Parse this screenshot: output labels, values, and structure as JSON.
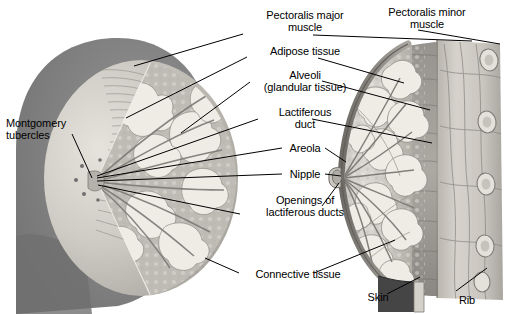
{
  "figure": {
    "background_color": "#ffffff",
    "text_color": "#000000",
    "view_left": "anterior cut-away view",
    "view_right": "sagittal cross-section view"
  },
  "labels": [
    {
      "id": "pectoralis-major-muscle",
      "line1": "Pectoralis major",
      "line2": "muscle",
      "x": 245,
      "y": 10,
      "w": 120,
      "align": "ctr"
    },
    {
      "id": "pectoralis-minor-muscle",
      "line1": "Pectoralis minor",
      "line2": "muscle",
      "x": 367,
      "y": 7,
      "w": 120,
      "align": "ctr"
    },
    {
      "id": "adipose-tissue",
      "line1": "Adipose tissue",
      "line2": "",
      "x": 245,
      "y": 46,
      "w": 120,
      "align": "ctr"
    },
    {
      "id": "alveoli-glandular-tissue",
      "line1": "Alveoli",
      "line2": "(glandular tissue)",
      "x": 245,
      "y": 70,
      "w": 120,
      "align": "ctr"
    },
    {
      "id": "lactiferous-duct",
      "line1": "Lactiferous",
      "line2": "duct",
      "x": 245,
      "y": 107,
      "w": 120,
      "align": "ctr"
    },
    {
      "id": "areola",
      "line1": "Areola",
      "line2": "",
      "x": 245,
      "y": 143,
      "w": 120,
      "align": "ctr"
    },
    {
      "id": "nipple",
      "line1": "Nipple",
      "line2": "",
      "x": 245,
      "y": 169,
      "w": 120,
      "align": "ctr"
    },
    {
      "id": "openings-of-lactiferous-ducts",
      "line1": "Openings of",
      "line2": "lactiferous ducts",
      "x": 243,
      "y": 195,
      "w": 124,
      "align": "ctr"
    },
    {
      "id": "montgomery-tubercles",
      "line1": "Montgomery",
      "line2": "tubercles",
      "x": 6,
      "y": 118,
      "w": 90,
      "align": "lft"
    },
    {
      "id": "connective-tissue",
      "line1": "Connective tissue",
      "line2": "",
      "x": 243,
      "y": 269,
      "w": 110,
      "align": "ctr"
    },
    {
      "id": "skin",
      "line1": "Skin",
      "line2": "",
      "x": 358,
      "y": 292,
      "w": 40,
      "align": "ctr"
    },
    {
      "id": "rib",
      "line1": "Rib",
      "line2": "",
      "x": 452,
      "y": 295,
      "w": 30,
      "align": "ctr"
    }
  ],
  "leader_lines": [
    {
      "id": "leader-pectoralis-major-left",
      "x1": 243,
      "y1": 34,
      "x2": 134,
      "y2": 66
    },
    {
      "id": "leader-pectoralis-major-right",
      "x2": 472,
      "y2": 41,
      "x1": 313,
      "y1": 35
    },
    {
      "id": "leader-pectoralis-minor",
      "x1": 418,
      "y1": 30,
      "x2": 500,
      "y2": 44
    },
    {
      "id": "leader-adipose-left",
      "x1": 247,
      "y1": 57,
      "x2": 126,
      "y2": 118
    },
    {
      "id": "leader-adipose-right",
      "x1": 318,
      "y1": 58,
      "x2": 404,
      "y2": 83
    },
    {
      "id": "leader-alveoli-left",
      "x1": 250,
      "y1": 82,
      "x2": 181,
      "y2": 133
    },
    {
      "id": "leader-alveoli-right",
      "x1": 322,
      "y1": 81,
      "x2": 430,
      "y2": 110
    },
    {
      "id": "leader-lactiferous-left",
      "x1": 258,
      "y1": 119,
      "x2": 97,
      "y2": 176
    },
    {
      "id": "leader-lactiferous-right",
      "x1": 312,
      "y1": 119,
      "x2": 432,
      "y2": 143
    },
    {
      "id": "leader-areola-left",
      "x1": 282,
      "y1": 148,
      "x2": 97,
      "y2": 178
    },
    {
      "id": "leader-areola-right",
      "x1": 325,
      "y1": 148,
      "x2": 346,
      "y2": 162
    },
    {
      "id": "leader-nipple-left",
      "x1": 282,
      "y1": 174,
      "x2": 97,
      "y2": 181
    },
    {
      "id": "leader-nipple-right",
      "x1": 325,
      "y1": 174,
      "x2": 341,
      "y2": 176
    },
    {
      "id": "leader-openings-left",
      "x1": 240,
      "y1": 214,
      "x2": 98,
      "y2": 185
    },
    {
      "id": "leader-openings-right",
      "x1": 322,
      "y1": 206,
      "x2": 339,
      "y2": 183
    },
    {
      "id": "leader-montgomery",
      "x1": 72,
      "y1": 134,
      "x2": 92,
      "y2": 178
    },
    {
      "id": "leader-connective-left",
      "x1": 239,
      "y1": 273,
      "x2": 205,
      "y2": 258
    },
    {
      "id": "leader-connective-right",
      "x1": 314,
      "y1": 273,
      "x2": 395,
      "y2": 240
    },
    {
      "id": "leader-skin",
      "x1": 387,
      "y1": 294,
      "x2": 420,
      "y2": 277
    },
    {
      "id": "leader-rib",
      "x1": 456,
      "y1": 291,
      "x2": 487,
      "y2": 268
    }
  ]
}
